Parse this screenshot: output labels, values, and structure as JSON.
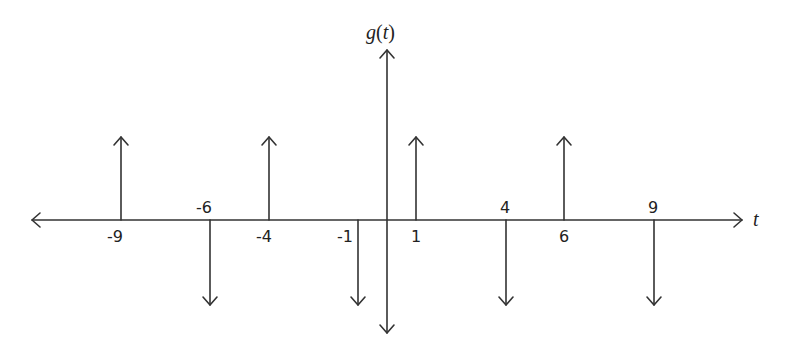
{
  "diagram": {
    "title_y": "g(t)",
    "title_y_func": "g",
    "title_y_arg": "t",
    "title_x": "t",
    "line_color": "#333333",
    "axis": {
      "y_pixel": 220,
      "x_left": 32,
      "x_right": 742,
      "origin_x": 387,
      "y_top": 50,
      "y_bottom": 333
    }
  },
  "impulses": [
    {
      "t": -9,
      "label": "-9",
      "direction": "up",
      "x": 121,
      "label_pos": "below"
    },
    {
      "t": -6,
      "label": "-6",
      "direction": "down",
      "x": 210,
      "label_pos": "above"
    },
    {
      "t": -4,
      "label": "-4",
      "direction": "up",
      "x": 269,
      "label_pos": "below"
    },
    {
      "t": -1,
      "label": "-1",
      "direction": "down",
      "x": 358,
      "label_pos": "below"
    },
    {
      "t": 1,
      "label": "1",
      "direction": "up",
      "x": 416,
      "label_pos": "below"
    },
    {
      "t": 4,
      "label": "4",
      "direction": "down",
      "x": 506,
      "label_pos": "above"
    },
    {
      "t": 6,
      "label": "6",
      "direction": "up",
      "x": 564,
      "label_pos": "below"
    },
    {
      "t": 9,
      "label": "9",
      "direction": "down",
      "x": 654,
      "label_pos": "above"
    }
  ],
  "chart_data": {
    "type": "impulse",
    "title": "g(t)",
    "xlabel": "t",
    "ylabel": "g(t)",
    "x": [
      -9,
      -6,
      -4,
      -1,
      1,
      4,
      6,
      9
    ],
    "values": [
      1,
      -1,
      1,
      -1,
      1,
      -1,
      1,
      -1
    ],
    "tick_labels": [
      "-9",
      "-6",
      "-4",
      "-1",
      "1",
      "4",
      "6",
      "9"
    ],
    "grid": false
  }
}
